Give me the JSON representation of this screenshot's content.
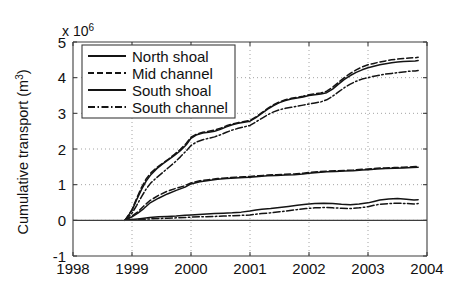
{
  "chart_data": {
    "type": "line",
    "title": "",
    "subtitle": "",
    "xlabel": "",
    "ylabel": "Cumulative transport (m",
    "ylabel_superscript": "3",
    "ylabel_suffix": ")",
    "y_exponent_prefix": "x 10",
    "y_exponent_power": "6",
    "y_scale_factor": 1000000,
    "xlim": [
      1998,
      2004
    ],
    "ylim": [
      -1,
      5
    ],
    "grid": true,
    "grid_style": "dotted",
    "legend_position": "upper left",
    "x_ticks": [
      1998,
      1999,
      2000,
      2001,
      2002,
      2003,
      2004
    ],
    "x_tick_labels": [
      "1998",
      "1999",
      "2000",
      "2001",
      "2002",
      "2003",
      "2004"
    ],
    "y_ticks": [
      -1,
      0,
      1,
      2,
      3,
      4,
      5
    ],
    "y_tick_labels": [
      "-1",
      "0",
      "1",
      "2",
      "3",
      "4",
      "5"
    ],
    "legend": [
      "North shoal",
      "Mid channel",
      "South shoal",
      "South channel"
    ],
    "series": [
      {
        "name": "North shoal",
        "linestyle": "solid",
        "x": [
          1998.88,
          1999.0,
          1999.1,
          1999.2,
          1999.3,
          1999.45,
          1999.6,
          1999.75,
          1999.9,
          2000.0,
          2000.15,
          2000.3,
          2000.45,
          2000.6,
          2000.75,
          2000.9,
          2001.0,
          2001.15,
          2001.3,
          2001.45,
          2001.6,
          2001.75,
          2001.9,
          2002.0,
          2002.15,
          2002.3,
          2002.45,
          2002.6,
          2002.75,
          2002.9,
          2003.0,
          2003.15,
          2003.3,
          2003.45,
          2003.6,
          2003.75,
          2003.85
        ],
        "y": [
          0.0,
          0.1,
          0.2,
          0.33,
          0.48,
          0.62,
          0.74,
          0.84,
          0.93,
          1.02,
          1.08,
          1.12,
          1.15,
          1.17,
          1.19,
          1.2,
          1.21,
          1.23,
          1.25,
          1.26,
          1.27,
          1.28,
          1.3,
          1.32,
          1.34,
          1.36,
          1.37,
          1.38,
          1.39,
          1.41,
          1.42,
          1.44,
          1.45,
          1.46,
          1.47,
          1.48,
          1.49
        ]
      },
      {
        "name": "Mid channel",
        "linestyle": "dashed",
        "x": [
          1998.88,
          1999.0,
          1999.1,
          1999.2,
          1999.3,
          1999.45,
          1999.6,
          1999.75,
          1999.9,
          2000.0,
          2000.15,
          2000.3,
          2000.45,
          2000.6,
          2000.75,
          2000.9,
          2001.0,
          2001.15,
          2001.3,
          2001.45,
          2001.6,
          2001.75,
          2001.9,
          2002.0,
          2002.15,
          2002.3,
          2002.45,
          2002.6,
          2002.75,
          2002.9,
          2003.0,
          2003.15,
          2003.3,
          2003.45,
          2003.6,
          2003.75,
          2003.85
        ],
        "y": [
          0.0,
          0.12,
          0.24,
          0.4,
          0.55,
          0.7,
          0.82,
          0.9,
          0.97,
          1.05,
          1.11,
          1.14,
          1.17,
          1.19,
          1.21,
          1.22,
          1.23,
          1.25,
          1.27,
          1.28,
          1.29,
          1.3,
          1.32,
          1.34,
          1.36,
          1.38,
          1.39,
          1.4,
          1.41,
          1.43,
          1.44,
          1.46,
          1.47,
          1.48,
          1.49,
          1.5,
          1.51
        ]
      },
      {
        "name": "South shoal",
        "linestyle": "solid",
        "x": [
          1998.88,
          1999.0,
          1999.1,
          1999.2,
          1999.3,
          1999.45,
          1999.6,
          1999.75,
          1999.9,
          2000.0,
          2000.2,
          2000.4,
          2000.55,
          2000.7,
          2000.85,
          2001.0,
          2001.1,
          2001.2,
          2001.35,
          2001.5,
          2001.65,
          2001.8,
          2001.95,
          2002.1,
          2002.25,
          2002.4,
          2002.55,
          2002.7,
          2002.85,
          2003.0,
          2003.1,
          2003.2,
          2003.35,
          2003.5,
          2003.65,
          2003.78,
          2003.85
        ],
        "y": [
          0.0,
          0.02,
          0.04,
          0.06,
          0.08,
          0.1,
          0.11,
          0.12,
          0.14,
          0.15,
          0.17,
          0.19,
          0.2,
          0.21,
          0.23,
          0.26,
          0.29,
          0.31,
          0.33,
          0.36,
          0.39,
          0.42,
          0.45,
          0.47,
          0.48,
          0.47,
          0.45,
          0.44,
          0.46,
          0.49,
          0.53,
          0.57,
          0.6,
          0.61,
          0.59,
          0.57,
          0.58
        ]
      },
      {
        "name": "South channel",
        "linestyle": "dashdot",
        "x": [
          1998.88,
          1999.0,
          1999.1,
          1999.2,
          1999.3,
          1999.45,
          1999.6,
          1999.75,
          1999.9,
          2000.0,
          2000.2,
          2000.4,
          2000.55,
          2000.7,
          2000.85,
          2001.0,
          2001.1,
          2001.2,
          2001.35,
          2001.5,
          2001.65,
          2001.8,
          2001.95,
          2002.1,
          2002.25,
          2002.4,
          2002.55,
          2002.7,
          2002.85,
          2003.0,
          2003.1,
          2003.2,
          2003.35,
          2003.5,
          2003.65,
          2003.78,
          2003.85
        ],
        "y": [
          0.0,
          0.01,
          0.02,
          0.03,
          0.04,
          0.05,
          0.06,
          0.07,
          0.08,
          0.09,
          0.1,
          0.11,
          0.12,
          0.13,
          0.14,
          0.15,
          0.17,
          0.19,
          0.21,
          0.24,
          0.27,
          0.3,
          0.33,
          0.35,
          0.36,
          0.35,
          0.34,
          0.33,
          0.35,
          0.38,
          0.42,
          0.45,
          0.47,
          0.48,
          0.47,
          0.46,
          0.47
        ]
      },
      {
        "name": "North shoal upper band",
        "linestyle": "solid",
        "x": [
          1998.88,
          1999.0,
          1999.08,
          1999.16,
          1999.24,
          1999.32,
          1999.42,
          1999.52,
          1999.62,
          1999.72,
          1999.82,
          1999.92,
          2000.0,
          2000.1,
          2000.2,
          2000.3,
          2000.4,
          2000.5,
          2000.6,
          2000.7,
          2000.8,
          2000.9,
          2001.0,
          2001.1,
          2001.2,
          2001.3,
          2001.4,
          2001.5,
          2001.6,
          2001.7,
          2001.8,
          2001.9,
          2002.0,
          2002.1,
          2002.2,
          2002.3,
          2002.4,
          2002.5,
          2002.6,
          2002.7,
          2002.8,
          2002.9,
          2003.0,
          2003.1,
          2003.2,
          2003.3,
          2003.4,
          2003.5,
          2003.6,
          2003.7,
          2003.8,
          2003.85
        ],
        "y": [
          0.0,
          0.28,
          0.58,
          0.86,
          1.1,
          1.28,
          1.45,
          1.58,
          1.7,
          1.82,
          1.95,
          2.12,
          2.3,
          2.4,
          2.45,
          2.47,
          2.5,
          2.55,
          2.62,
          2.68,
          2.72,
          2.75,
          2.78,
          2.88,
          3.0,
          3.12,
          3.22,
          3.3,
          3.36,
          3.4,
          3.43,
          3.46,
          3.5,
          3.52,
          3.54,
          3.58,
          3.68,
          3.82,
          3.95,
          4.06,
          4.15,
          4.22,
          4.28,
          4.32,
          4.36,
          4.39,
          4.42,
          4.44,
          4.45,
          4.46,
          4.47,
          4.48
        ]
      },
      {
        "name": "Mid channel upper band",
        "linestyle": "dashed",
        "x": [
          1998.88,
          1999.0,
          1999.08,
          1999.16,
          1999.24,
          1999.32,
          1999.42,
          1999.52,
          1999.62,
          1999.72,
          1999.82,
          1999.92,
          2000.0,
          2000.1,
          2000.2,
          2000.3,
          2000.4,
          2000.5,
          2000.6,
          2000.7,
          2000.8,
          2000.9,
          2001.0,
          2001.1,
          2001.2,
          2001.3,
          2001.4,
          2001.5,
          2001.6,
          2001.7,
          2001.8,
          2001.9,
          2002.0,
          2002.1,
          2002.2,
          2002.3,
          2002.4,
          2002.5,
          2002.6,
          2002.7,
          2002.8,
          2002.9,
          2003.0,
          2003.1,
          2003.2,
          2003.3,
          2003.4,
          2003.5,
          2003.6,
          2003.7,
          2003.8,
          2003.85
        ],
        "y": [
          0.0,
          0.3,
          0.62,
          0.92,
          1.16,
          1.33,
          1.48,
          1.6,
          1.72,
          1.85,
          1.99,
          2.16,
          2.33,
          2.42,
          2.47,
          2.5,
          2.53,
          2.58,
          2.65,
          2.7,
          2.74,
          2.77,
          2.8,
          2.9,
          3.02,
          3.14,
          3.24,
          3.32,
          3.38,
          3.42,
          3.45,
          3.48,
          3.52,
          3.55,
          3.57,
          3.62,
          3.73,
          3.87,
          4.0,
          4.12,
          4.22,
          4.3,
          4.36,
          4.4,
          4.44,
          4.47,
          4.5,
          4.52,
          4.54,
          4.55,
          4.56,
          4.57
        ]
      },
      {
        "name": "South channel upper band",
        "linestyle": "dashdot",
        "x": [
          1998.88,
          1999.0,
          1999.08,
          1999.16,
          1999.24,
          1999.32,
          1999.42,
          1999.52,
          1999.62,
          1999.72,
          1999.82,
          1999.92,
          2000.0,
          2000.1,
          2000.2,
          2000.3,
          2000.4,
          2000.5,
          2000.6,
          2000.7,
          2000.8,
          2000.9,
          2001.0,
          2001.1,
          2001.2,
          2001.3,
          2001.4,
          2001.5,
          2001.6,
          2001.7,
          2001.8,
          2001.9,
          2002.0,
          2002.1,
          2002.2,
          2002.3,
          2002.4,
          2002.5,
          2002.6,
          2002.7,
          2002.8,
          2002.9,
          2003.0,
          2003.1,
          2003.2,
          2003.3,
          2003.4,
          2003.5,
          2003.6,
          2003.7,
          2003.8,
          2003.85
        ],
        "y": [
          0.0,
          0.2,
          0.42,
          0.66,
          0.88,
          1.05,
          1.2,
          1.34,
          1.48,
          1.62,
          1.78,
          1.95,
          2.1,
          2.2,
          2.26,
          2.3,
          2.34,
          2.4,
          2.47,
          2.53,
          2.58,
          2.62,
          2.66,
          2.76,
          2.86,
          2.96,
          3.04,
          3.1,
          3.14,
          3.17,
          3.2,
          3.23,
          3.26,
          3.29,
          3.32,
          3.38,
          3.48,
          3.6,
          3.72,
          3.82,
          3.9,
          3.96,
          4.0,
          4.04,
          4.07,
          4.1,
          4.12,
          4.14,
          4.16,
          4.18,
          4.19,
          4.2
        ]
      }
    ]
  },
  "figure": {
    "background_color": "#ffffff",
    "line_color": "#141414",
    "axis_color": "#3d3d3d",
    "grid_color": "#9a9a9a"
  }
}
